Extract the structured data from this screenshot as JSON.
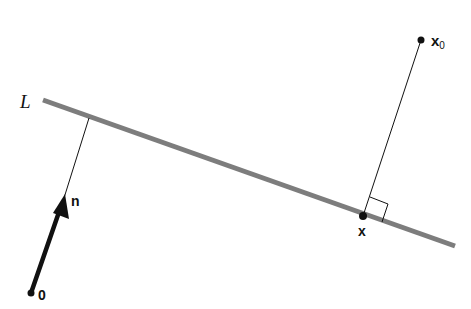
{
  "diagram": {
    "line_label": "L",
    "normal_label": "n",
    "origin_label": "0",
    "foot_label": "x",
    "point_label_base": "x",
    "point_label_sub": "0",
    "colors": {
      "line": "#7d7d7d",
      "ink": "#111111",
      "background": "#ffffff"
    }
  }
}
